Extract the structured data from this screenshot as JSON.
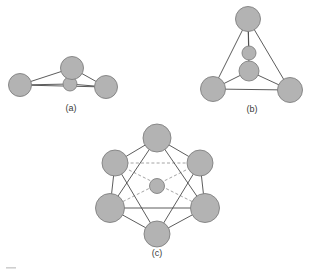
{
  "figure": {
    "background_color": "#ffffff",
    "atom_fill_color": "#b3b3b3",
    "atom_stroke_color": "#808080",
    "bond_solid_color": "#4a4a4a",
    "bond_dashed_color": "#9a9a9a",
    "label_color": "#3a3a3a"
  },
  "panels": [
    {
      "id": "a",
      "label": "(a)",
      "label_x": 71,
      "label_y": 109,
      "description": "three large spheres in a triangle with one small sphere near the centre",
      "atoms": [
        {
          "name": "atom-a-left",
          "cx": 20,
          "cy": 85,
          "r": 11.5,
          "size": "large"
        },
        {
          "name": "atom-a-right",
          "cx": 106,
          "cy": 87,
          "r": 11.5,
          "size": "large"
        },
        {
          "name": "atom-a-top",
          "cx": 72,
          "cy": 68,
          "r": 11.5,
          "size": "large"
        },
        {
          "name": "atom-a-centre",
          "cx": 70,
          "cy": 84,
          "r": 7.0,
          "size": "small"
        }
      ],
      "bonds": [
        {
          "from": "atom-a-left",
          "to": "atom-a-right",
          "style": "solid"
        },
        {
          "from": "atom-a-left",
          "to": "atom-a-top",
          "style": "solid"
        },
        {
          "from": "atom-a-right",
          "to": "atom-a-top",
          "style": "solid"
        },
        {
          "from": "atom-a-left",
          "to": "atom-a-centre",
          "style": "solid"
        },
        {
          "from": "atom-a-right",
          "to": "atom-a-centre",
          "style": "solid"
        },
        {
          "from": "atom-a-top",
          "to": "atom-a-centre",
          "style": "solid"
        }
      ]
    },
    {
      "id": "b",
      "label": "(b)",
      "label_x": 252,
      "label_y": 110,
      "description": "three large spheres forming a triangle with one large and one small sphere stacked inside",
      "atoms": [
        {
          "name": "atom-b-top",
          "cx": 248,
          "cy": 19,
          "r": 12.5,
          "size": "large"
        },
        {
          "name": "atom-b-left",
          "cx": 213,
          "cy": 89,
          "r": 12.5,
          "size": "large"
        },
        {
          "name": "atom-b-right",
          "cx": 290,
          "cy": 90,
          "r": 12.5,
          "size": "large"
        },
        {
          "name": "atom-b-inner",
          "cx": 249,
          "cy": 71,
          "r": 10.0,
          "size": "medium"
        },
        {
          "name": "atom-b-inner-top",
          "cx": 249,
          "cy": 53,
          "r": 7.0,
          "size": "small"
        }
      ],
      "bonds": [
        {
          "from": "atom-b-top",
          "to": "atom-b-left",
          "style": "solid"
        },
        {
          "from": "atom-b-top",
          "to": "atom-b-right",
          "style": "solid"
        },
        {
          "from": "atom-b-left",
          "to": "atom-b-right",
          "style": "solid"
        },
        {
          "from": "atom-b-top",
          "to": "atom-b-inner-top",
          "style": "solid"
        },
        {
          "from": "atom-b-left",
          "to": "atom-b-inner",
          "style": "solid"
        },
        {
          "from": "atom-b-right",
          "to": "atom-b-inner",
          "style": "solid"
        },
        {
          "from": "atom-b-top",
          "to": "atom-b-inner",
          "style": "solid"
        }
      ]
    },
    {
      "id": "c",
      "label": "(c)",
      "label_x": 157,
      "label_y": 254,
      "description": "six large spheres at the vertices of a hexagon (octahedron projection) with one small sphere at the centre",
      "atoms": [
        {
          "name": "atom-c-top",
          "cx": 157,
          "cy": 138,
          "r": 14.0,
          "size": "large"
        },
        {
          "name": "atom-c-upper-left",
          "cx": 115,
          "cy": 163,
          "r": 13.0,
          "size": "large"
        },
        {
          "name": "atom-c-upper-right",
          "cx": 200,
          "cy": 163,
          "r": 13.0,
          "size": "large"
        },
        {
          "name": "atom-c-lower-left",
          "cx": 110,
          "cy": 208,
          "r": 14.5,
          "size": "large"
        },
        {
          "name": "atom-c-lower-right",
          "cx": 205,
          "cy": 208,
          "r": 14.5,
          "size": "large"
        },
        {
          "name": "atom-c-bottom",
          "cx": 157,
          "cy": 234,
          "r": 13.0,
          "size": "large"
        },
        {
          "name": "atom-c-centre",
          "cx": 157,
          "cy": 186,
          "r": 7.5,
          "size": "small"
        }
      ],
      "bonds": [
        {
          "from": "atom-c-top",
          "to": "atom-c-upper-left",
          "style": "solid"
        },
        {
          "from": "atom-c-top",
          "to": "atom-c-upper-right",
          "style": "solid"
        },
        {
          "from": "atom-c-top",
          "to": "atom-c-lower-left",
          "style": "solid"
        },
        {
          "from": "atom-c-top",
          "to": "atom-c-lower-right",
          "style": "solid"
        },
        {
          "from": "atom-c-upper-left",
          "to": "atom-c-lower-left",
          "style": "solid"
        },
        {
          "from": "atom-c-upper-right",
          "to": "atom-c-lower-right",
          "style": "solid"
        },
        {
          "from": "atom-c-lower-left",
          "to": "atom-c-lower-right",
          "style": "solid"
        },
        {
          "from": "atom-c-lower-left",
          "to": "atom-c-bottom",
          "style": "solid"
        },
        {
          "from": "atom-c-lower-right",
          "to": "atom-c-bottom",
          "style": "solid"
        },
        {
          "from": "atom-c-upper-left",
          "to": "atom-c-bottom",
          "style": "solid"
        },
        {
          "from": "atom-c-upper-right",
          "to": "atom-c-bottom",
          "style": "solid"
        },
        {
          "from": "atom-c-upper-left",
          "to": "atom-c-upper-right",
          "style": "dashed"
        },
        {
          "from": "atom-c-upper-left",
          "to": "atom-c-lower-right",
          "style": "dashed"
        },
        {
          "from": "atom-c-upper-right",
          "to": "atom-c-lower-left",
          "style": "dashed"
        }
      ]
    }
  ]
}
